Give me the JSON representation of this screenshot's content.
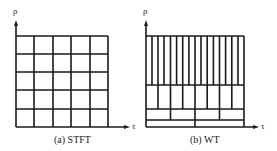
{
  "panels": [
    {
      "id": "stft",
      "caption": "(a) STFT",
      "y_label": "ρ",
      "x_label": "τ",
      "grid": {
        "cols": 5,
        "rows": 5
      }
    },
    {
      "id": "wt",
      "caption": "(b) WT",
      "y_label": "ρ",
      "x_label": "τ",
      "tiling": {
        "rows_from_top": [
          16,
          8,
          4,
          2
        ]
      }
    }
  ],
  "colors": {
    "line": "#1a1a1a",
    "background": "#ffffff"
  }
}
